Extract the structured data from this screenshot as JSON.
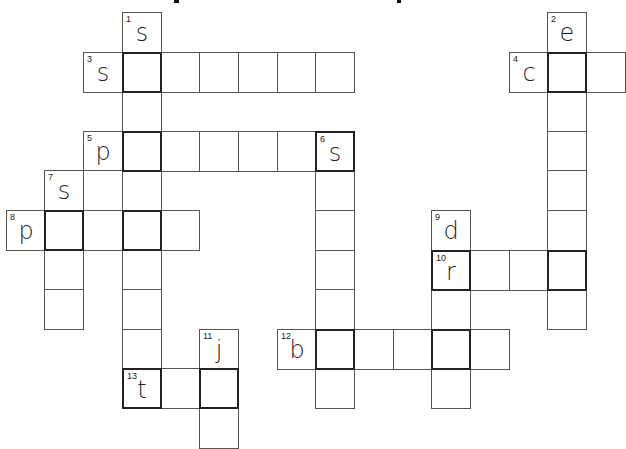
{
  "title": {
    "text": "",
    "fragments": [
      {
        "x": 174,
        "w": 5
      },
      {
        "x": 397,
        "w": 4
      }
    ]
  },
  "grid": {
    "origin_x": 5.6,
    "origin_y": 12,
    "col_w": 38.7,
    "row_h": 39.6,
    "col_offset": 2
  },
  "cells": [
    {
      "c": 1,
      "r": 0,
      "num": "1",
      "letter": "s"
    },
    {
      "c": 12,
      "r": 0,
      "num": "2",
      "letter": "e"
    },
    {
      "c": 0,
      "r": 1,
      "num": "3",
      "letter": "s"
    },
    {
      "c": 1,
      "r": 1,
      "cross": true
    },
    {
      "c": 2,
      "r": 1
    },
    {
      "c": 3,
      "r": 1
    },
    {
      "c": 4,
      "r": 1
    },
    {
      "c": 5,
      "r": 1
    },
    {
      "c": 6,
      "r": 1
    },
    {
      "c": 11,
      "r": 1,
      "num": "4",
      "letter": "c"
    },
    {
      "c": 12,
      "r": 1,
      "cross": true
    },
    {
      "c": 13,
      "r": 1
    },
    {
      "c": 1,
      "r": 2
    },
    {
      "c": 12,
      "r": 2
    },
    {
      "c": 0,
      "r": 3,
      "num": "5",
      "letter": "p"
    },
    {
      "c": 1,
      "r": 3,
      "cross": true
    },
    {
      "c": 2,
      "r": 3
    },
    {
      "c": 3,
      "r": 3
    },
    {
      "c": 4,
      "r": 3
    },
    {
      "c": 5,
      "r": 3
    },
    {
      "c": 6,
      "r": 3,
      "num": "6",
      "letter": "s",
      "cross": true
    },
    {
      "c": 12,
      "r": 3
    },
    {
      "c": -1,
      "r": 4,
      "num": "7",
      "letter": "s"
    },
    {
      "c": 0,
      "r": 4
    },
    {
      "c": 1,
      "r": 4
    },
    {
      "c": 6,
      "r": 4
    },
    {
      "c": 12,
      "r": 4
    },
    {
      "c": -2,
      "r": 5,
      "num": "8",
      "letter": "p"
    },
    {
      "c": -1,
      "r": 5,
      "cross": true
    },
    {
      "c": 0,
      "r": 5
    },
    {
      "c": 1,
      "r": 5,
      "cross": true
    },
    {
      "c": 2,
      "r": 5
    },
    {
      "c": 6,
      "r": 5
    },
    {
      "c": 9,
      "r": 5,
      "num": "9",
      "letter": "d"
    },
    {
      "c": 12,
      "r": 5
    },
    {
      "c": -1,
      "r": 6
    },
    {
      "c": 1,
      "r": 6
    },
    {
      "c": 6,
      "r": 6
    },
    {
      "c": 9,
      "r": 6,
      "num": "10",
      "letter": "r",
      "cross": true
    },
    {
      "c": 10,
      "r": 6
    },
    {
      "c": 11,
      "r": 6
    },
    {
      "c": 12,
      "r": 6,
      "cross": true
    },
    {
      "c": -1,
      "r": 7
    },
    {
      "c": 1,
      "r": 7
    },
    {
      "c": 6,
      "r": 7
    },
    {
      "c": 9,
      "r": 7
    },
    {
      "c": 12,
      "r": 7
    },
    {
      "c": 1,
      "r": 8
    },
    {
      "c": 3,
      "r": 8,
      "num": "11",
      "letter": "j"
    },
    {
      "c": 5,
      "r": 8,
      "num": "12",
      "letter": "b"
    },
    {
      "c": 6,
      "r": 8,
      "cross": true
    },
    {
      "c": 7,
      "r": 8
    },
    {
      "c": 8,
      "r": 8
    },
    {
      "c": 9,
      "r": 8,
      "cross": true
    },
    {
      "c": 10,
      "r": 8
    },
    {
      "c": 1,
      "r": 9,
      "num": "13",
      "letter": "t",
      "cross": true
    },
    {
      "c": 2,
      "r": 9
    },
    {
      "c": 3,
      "r": 9,
      "cross": true
    },
    {
      "c": 6,
      "r": 9
    },
    {
      "c": 9,
      "r": 9
    },
    {
      "c": 3,
      "r": 10
    }
  ],
  "clues": {
    "across": [
      {
        "num": "3",
        "hint": "s",
        "length": 7
      },
      {
        "num": "4",
        "hint": "c",
        "length": 3
      },
      {
        "num": "5",
        "hint": "p",
        "length": 7
      },
      {
        "num": "8",
        "hint": "p",
        "length": 5
      },
      {
        "num": "10",
        "hint": "r",
        "length": 4
      },
      {
        "num": "12",
        "hint": "b",
        "length": 6
      },
      {
        "num": "13",
        "hint": "t",
        "length": 3
      }
    ],
    "down": [
      {
        "num": "1",
        "hint": "s",
        "length": 10
      },
      {
        "num": "2",
        "hint": "e",
        "length": 8
      },
      {
        "num": "6",
        "hint": "s",
        "length": 7
      },
      {
        "num": "7",
        "hint": "s",
        "length": 4
      },
      {
        "num": "9",
        "hint": "d",
        "length": 5
      },
      {
        "num": "11",
        "hint": "j",
        "length": 3
      }
    ]
  }
}
